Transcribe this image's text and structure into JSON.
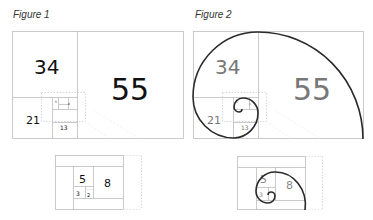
{
  "figures": [
    {
      "title": "Figure 1",
      "labels": {
        "n55": "55",
        "n34": "34",
        "n21": "21",
        "n13": "13",
        "n8": "8",
        "n5": "5"
      },
      "inset_labels": {
        "n8": "8",
        "n5": "5",
        "n3": "3",
        "n2": "2"
      }
    },
    {
      "title": "Figure 2",
      "labels": {
        "n55": "55",
        "n34": "34",
        "n21": "21",
        "n13": "13",
        "n8": "8",
        "n5": "5"
      },
      "inset_labels": {
        "n8": "8",
        "n5": "5",
        "n3": "3"
      }
    }
  ],
  "colors": {
    "frame": "#bdbdbd",
    "text_fig1": "#111111",
    "text_fig2": "#777777",
    "spiral": "#2a2a2a",
    "dotted": "#cccccc"
  }
}
